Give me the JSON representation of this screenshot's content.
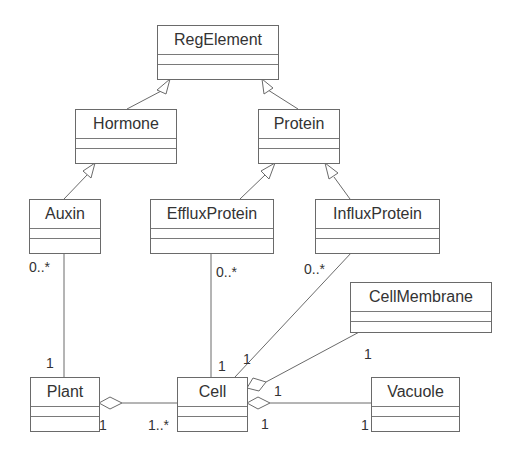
{
  "diagram": {
    "type": "UML class diagram",
    "classes": [
      {
        "id": "regelement",
        "name": "RegElement"
      },
      {
        "id": "hormone",
        "name": "Hormone"
      },
      {
        "id": "protein",
        "name": "Protein"
      },
      {
        "id": "auxin",
        "name": "Auxin"
      },
      {
        "id": "effluxprotein",
        "name": "EffluxProtein"
      },
      {
        "id": "influxprotein",
        "name": "InfluxProtein"
      },
      {
        "id": "cellmembrane",
        "name": "CellMembrane"
      },
      {
        "id": "plant",
        "name": "Plant"
      },
      {
        "id": "cell",
        "name": "Cell"
      },
      {
        "id": "vacuole",
        "name": "Vacuole"
      }
    ],
    "generalizations": [
      {
        "child": "Hormone",
        "parent": "RegElement"
      },
      {
        "child": "Protein",
        "parent": "RegElement"
      },
      {
        "child": "Auxin",
        "parent": "Hormone"
      },
      {
        "child": "EffluxProtein",
        "parent": "Protein"
      },
      {
        "child": "InfluxProtein",
        "parent": "Protein"
      }
    ],
    "associations": [
      {
        "from": "Auxin",
        "to": "Plant",
        "from_mult": "0..*",
        "to_mult": "1"
      },
      {
        "from": "EffluxProtein",
        "to": "Cell",
        "from_mult": "0..*",
        "to_mult": "1"
      },
      {
        "from": "InfluxProtein",
        "to": "Cell",
        "from_mult": "0..*",
        "to_mult": "1"
      }
    ],
    "aggregations": [
      {
        "whole": "Plant",
        "part": "Cell",
        "whole_mult": "1",
        "part_mult": "1..*"
      },
      {
        "whole": "Cell",
        "part": "CellMembrane",
        "whole_mult": "1",
        "part_mult": "1"
      },
      {
        "whole": "Cell",
        "part": "Vacuole",
        "whole_mult": "1",
        "part_mult": "1"
      }
    ],
    "labels": {
      "auxin_mult": "0..*",
      "plant_top_mult": "1",
      "efflux_mult": "0..*",
      "cell_efflux_mult": "1",
      "influx_mult": "0..*",
      "cell_influx_mult": "1",
      "membrane_mult": "1",
      "cell_membrane_end_mult": "1",
      "plant_agg_mult": "1",
      "cell_plant_mult": "1..*",
      "cell_vacuole_mult": "1",
      "vacuole_mult": "1"
    }
  }
}
